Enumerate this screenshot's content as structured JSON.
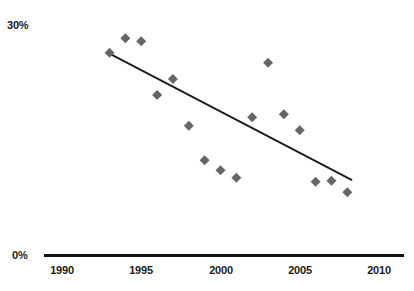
{
  "chart_data": {
    "type": "scatter",
    "title": "",
    "xlabel": "",
    "ylabel": "",
    "xlim": [
      1989,
      2011.5
    ],
    "ylim": [
      0,
      30
    ],
    "grid": false,
    "legend": null,
    "y_tick_labels": [
      "0%",
      "30%"
    ],
    "y_ticks": [
      0,
      30
    ],
    "x_tick_labels": [
      "1990",
      "1995",
      "2000",
      "2005",
      "2010"
    ],
    "x_ticks": [
      1990,
      1995,
      2000,
      2005,
      2010
    ],
    "marker": {
      "shape": "diamond",
      "color": "#666666",
      "size_px": 10
    },
    "series": [
      {
        "name": "data",
        "type": "scatter",
        "x": [
          1993,
          1994,
          1995,
          1996,
          1997,
          1998,
          1999,
          2000,
          2001,
          2002,
          2003,
          2004,
          2005,
          2006,
          2007,
          2008
        ],
        "values": [
          26.5,
          28.4,
          28.0,
          21.0,
          23.1,
          17.0,
          12.5,
          11.2,
          10.2,
          18.1,
          25.2,
          18.5,
          16.4,
          9.7,
          9.8,
          8.3
        ]
      },
      {
        "name": "trendline",
        "type": "line",
        "color": "#1a1a1a",
        "x": [
          1993,
          2008.3
        ],
        "values": [
          26.4,
          9.9
        ]
      }
    ]
  },
  "axes": {
    "x_axis_color": "#111111",
    "x_axis_width_px": 3
  }
}
